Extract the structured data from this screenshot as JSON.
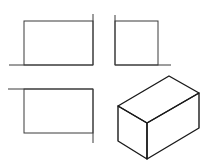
{
  "diagram": {
    "type": "orthographic-three-view-with-isometric",
    "colors": {
      "background": "#ffffff",
      "line": "#333333"
    },
    "views": [
      {
        "name": "front-view",
        "rect": {
          "x": 24,
          "y": 21,
          "w": 69,
          "h": 44
        },
        "extension_lines": [
          {
            "x1": 9,
            "y1": 65,
            "x2": 93,
            "y2": 65
          },
          {
            "x1": 93,
            "y1": 14,
            "x2": 93,
            "y2": 65
          }
        ]
      },
      {
        "name": "side-view",
        "rect": {
          "x": 115,
          "y": 21,
          "w": 43,
          "h": 44
        },
        "extension_lines": [
          {
            "x1": 115,
            "y1": 65,
            "x2": 171,
            "y2": 65
          },
          {
            "x1": 115,
            "y1": 15,
            "x2": 115,
            "y2": 65
          }
        ]
      },
      {
        "name": "top-view",
        "rect": {
          "x": 24,
          "y": 89,
          "w": 69,
          "h": 44
        },
        "extension_lines": [
          {
            "x1": 8,
            "y1": 89,
            "x2": 93,
            "y2": 89
          },
          {
            "x1": 93,
            "y1": 89,
            "x2": 93,
            "y2": 143
          }
        ]
      },
      {
        "name": "isometric-view",
        "vertices": {
          "top": [
            169,
            76
          ],
          "right_top": [
            199,
            93
          ],
          "left_top": [
            118,
            106
          ],
          "front_top": [
            147,
            123
          ],
          "left_bottom": [
            118,
            141
          ],
          "front_bottom": [
            147,
            159
          ],
          "right_bottom": [
            199,
            128
          ]
        }
      }
    ]
  }
}
